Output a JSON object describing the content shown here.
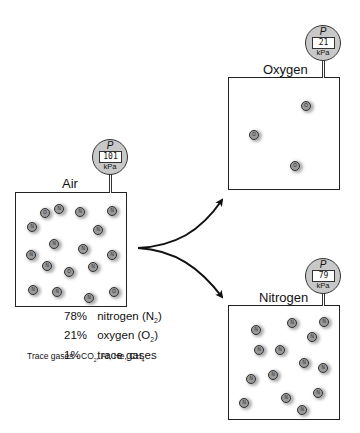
{
  "diagram": {
    "containers": [
      {
        "id": "air",
        "label": "Air",
        "gauge": {
          "symbol": "P",
          "value": "101",
          "unit": "kPa"
        },
        "box": {
          "x": 15,
          "y": 192,
          "w": 112,
          "h": 115
        },
        "label_pos": {
          "x": 62,
          "y": 176
        },
        "gauge_pos": {
          "x": 92,
          "y": 139
        },
        "molecules": [
          {
            "x": 40,
            "y": 208,
            "t": "O"
          },
          {
            "x": 54,
            "y": 204,
            "t": "N"
          },
          {
            "x": 75,
            "y": 207,
            "t": "N"
          },
          {
            "x": 107,
            "y": 206,
            "t": "N"
          },
          {
            "x": 27,
            "y": 222,
            "t": "N"
          },
          {
            "x": 93,
            "y": 225,
            "t": "N"
          },
          {
            "x": 49,
            "y": 239,
            "t": "N"
          },
          {
            "x": 78,
            "y": 244,
            "t": "N"
          },
          {
            "x": 26,
            "y": 250,
            "t": "N"
          },
          {
            "x": 107,
            "y": 250,
            "t": "N"
          },
          {
            "x": 42,
            "y": 261,
            "t": "N"
          },
          {
            "x": 88,
            "y": 262,
            "t": "N"
          },
          {
            "x": 64,
            "y": 267,
            "t": "O"
          },
          {
            "x": 28,
            "y": 285,
            "t": "N"
          },
          {
            "x": 52,
            "y": 287,
            "t": "N"
          },
          {
            "x": 84,
            "y": 293,
            "t": "N"
          },
          {
            "x": 109,
            "y": 287,
            "t": "O"
          }
        ]
      },
      {
        "id": "oxygen",
        "label": "Oxygen",
        "gauge": {
          "symbol": "P",
          "value": "21",
          "unit": "kPa"
        },
        "box": {
          "x": 228,
          "y": 77,
          "w": 112,
          "h": 113
        },
        "label_pos": {
          "x": 263,
          "y": 62
        },
        "gauge_pos": {
          "x": 305,
          "y": 25
        },
        "molecules": [
          {
            "x": 301,
            "y": 101,
            "t": "O"
          },
          {
            "x": 249,
            "y": 130,
            "t": "O"
          },
          {
            "x": 290,
            "y": 161,
            "t": "O"
          }
        ]
      },
      {
        "id": "nitrogen",
        "label": "Nitrogen",
        "gauge": {
          "symbol": "P",
          "value": "79",
          "unit": "kPa"
        },
        "box": {
          "x": 228,
          "y": 305,
          "w": 112,
          "h": 115
        },
        "label_pos": {
          "x": 259,
          "y": 290
        },
        "gauge_pos": {
          "x": 305,
          "y": 258
        },
        "molecules": [
          {
            "x": 287,
            "y": 318,
            "t": "N"
          },
          {
            "x": 319,
            "y": 317,
            "t": "N"
          },
          {
            "x": 251,
            "y": 325,
            "t": "N"
          },
          {
            "x": 307,
            "y": 332,
            "t": "N"
          },
          {
            "x": 254,
            "y": 345,
            "t": "N"
          },
          {
            "x": 275,
            "y": 345,
            "t": "N"
          },
          {
            "x": 299,
            "y": 358,
            "t": "N"
          },
          {
            "x": 318,
            "y": 363,
            "t": "N"
          },
          {
            "x": 268,
            "y": 370,
            "t": "N"
          },
          {
            "x": 246,
            "y": 374,
            "t": "N"
          },
          {
            "x": 313,
            "y": 388,
            "t": "N"
          },
          {
            "x": 281,
            "y": 393,
            "t": "N"
          },
          {
            "x": 239,
            "y": 398,
            "t": "N"
          },
          {
            "x": 297,
            "y": 405,
            "t": "N"
          }
        ]
      }
    ],
    "composition": [
      {
        "pct": "78%",
        "name": "nitrogen",
        "formula": "N",
        "sub": "2"
      },
      {
        "pct": "21%",
        "name": "oxygen",
        "formula": "O",
        "sub": "2"
      },
      {
        "pct": "1%",
        "name": "trace gases",
        "formula": "",
        "sub": ""
      }
    ],
    "trace_note": {
      "prefix": "Trace gases - ",
      "items": [
        {
          "f": "CO",
          "s": "2"
        },
        {
          "f": "Ar",
          "s": ""
        },
        {
          "f": "He",
          "s": ""
        },
        {
          "f": "CH",
          "s": "4"
        }
      ]
    },
    "arrows": [
      {
        "from": "air",
        "to": "oxygen"
      },
      {
        "from": "air",
        "to": "nitrogen"
      }
    ]
  }
}
